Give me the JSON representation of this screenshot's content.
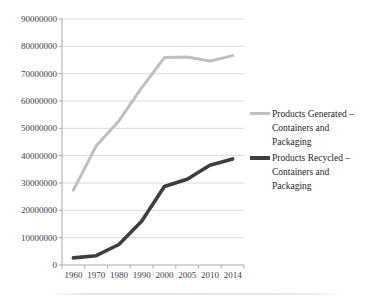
{
  "chart_data": {
    "type": "line",
    "title": "",
    "xlabel": "",
    "ylabel": "",
    "categories": [
      "1960",
      "1970",
      "1980",
      "1990",
      "2000",
      "2005",
      "2010",
      "2014"
    ],
    "series": [
      {
        "name": "Products Generated – Containers and Packaging",
        "color": "#BFBFBF",
        "line_width": 3,
        "values": [
          27400000,
          43500000,
          52700000,
          64800000,
          75900000,
          76100000,
          74600000,
          76600000
        ]
      },
      {
        "name": "Products Recycled – Containers and Packaging",
        "color": "#3F3F3F",
        "line_width": 3.6,
        "values": [
          2600000,
          3400000,
          7500000,
          16000000,
          28700000,
          31400000,
          36500000,
          38800000
        ]
      }
    ],
    "ylim": [
      0,
      90000000
    ],
    "ytick_step": 10000000,
    "ytick_labels": [
      "0",
      "10000000",
      "20000000",
      "30000000",
      "40000000",
      "50000000",
      "60000000",
      "70000000",
      "80000000",
      "90000000"
    ],
    "grid": true,
    "gridline_color": "#D9D9D9",
    "axis_color": "#ABABAB",
    "tick_label_color": "#404040",
    "legend_position": "right"
  },
  "legend": {
    "items": [
      {
        "label": "Products Generated –\nContainers and\nPackaging",
        "color": "#BFBFBF"
      },
      {
        "label": "Products Recycled –\nContainers and\nPackaging",
        "color": "#3F3F3F"
      }
    ]
  }
}
